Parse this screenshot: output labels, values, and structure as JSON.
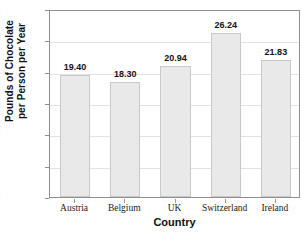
{
  "chart_data": {
    "type": "bar",
    "title": "",
    "xlabel": "Country",
    "ylabel_line1": "Pounds of Chocolate",
    "ylabel_line2": "per Person per Year",
    "categories": [
      "Austria",
      "Belgium",
      "UK",
      "Switzerland",
      "Ireland"
    ],
    "values": [
      19.4,
      18.3,
      20.94,
      26.24,
      21.83
    ],
    "value_labels": [
      "19.40",
      "18.30",
      "20.94",
      "26.24",
      "21.83"
    ],
    "ylim": [
      0,
      30
    ],
    "ytick_labels": [
      "0",
      "5",
      "10",
      "15",
      "20",
      "25",
      "30"
    ],
    "ytick_values": [
      0,
      5,
      10,
      15,
      20,
      25,
      30
    ],
    "grid": true,
    "legend": "none",
    "bar_fill_color": "#e9e9e9",
    "bar_edge_color": "#c9c9c9",
    "axis_color": "#8f8f8f",
    "gridline_color": "#e2e2e2",
    "text_color": "#111111"
  }
}
